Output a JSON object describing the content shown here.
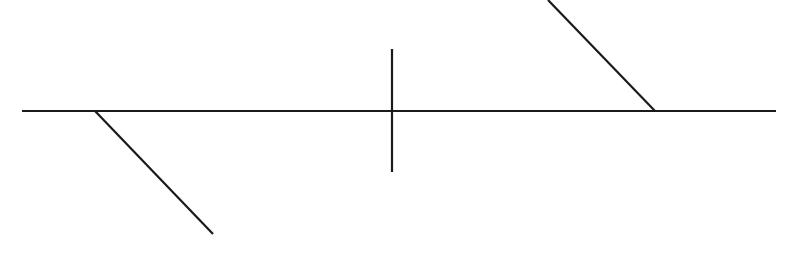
{
  "canvas": {
    "width": 789,
    "height": 266,
    "background": "#ffffff"
  },
  "style": {
    "stroke": "#1a1a1a",
    "stroke_width": 2.2
  },
  "segments": [
    {
      "name": "main-horizontal-line",
      "x1": 22,
      "y1": 111,
      "x2": 776,
      "y2": 111
    },
    {
      "name": "vertical-tick-line",
      "x1": 392,
      "y1": 49,
      "x2": 392,
      "y2": 172
    },
    {
      "name": "lower-left-diagonal-line",
      "x1": 95,
      "y1": 111,
      "x2": 213,
      "y2": 234
    },
    {
      "name": "upper-right-diagonal-line",
      "x1": 548,
      "y1": 0,
      "x2": 655,
      "y2": 111
    }
  ]
}
